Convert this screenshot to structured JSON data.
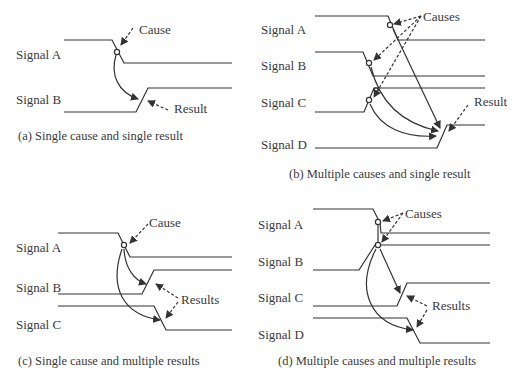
{
  "panels": {
    "a": {
      "caption": "(a) Single cause and single result",
      "signals": [
        "Signal A",
        "Signal B"
      ],
      "annotations": {
        "cause": "Cause",
        "result": "Result"
      }
    },
    "b": {
      "caption": "(b) Multiple causes and single result",
      "signals": [
        "Signal A",
        "Signal B",
        "Signal C",
        "Signal D"
      ],
      "annotations": {
        "cause": "Causes",
        "result": "Result"
      }
    },
    "c": {
      "caption": "(c) Single cause and multiple results",
      "signals": [
        "Signal A",
        "Signal B",
        "Signal C"
      ],
      "annotations": {
        "cause": "Cause",
        "result": "Results"
      }
    },
    "d": {
      "caption": "(d) Multiple causes and multiple results",
      "signals": [
        "Signal A",
        "Signal B",
        "Signal C",
        "Signal D"
      ],
      "annotations": {
        "cause": "Causes",
        "result": "Results"
      }
    }
  },
  "colors": {
    "line": "#333333",
    "background": "#ffffff"
  }
}
